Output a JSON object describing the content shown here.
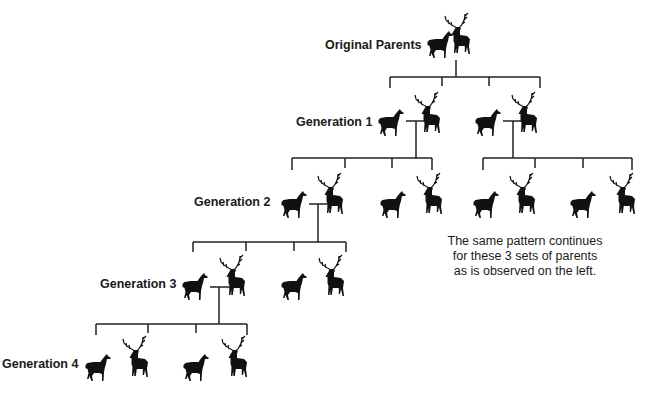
{
  "diagram": {
    "levels": [
      {
        "label": "Original Parents",
        "pairs": 1
      },
      {
        "label": "Generation 1",
        "pairs": 2
      },
      {
        "label": "Generation 2",
        "pairs": 4
      },
      {
        "label": "Generation 3",
        "pairs": 2
      },
      {
        "label": "Generation 4",
        "pairs": 2
      }
    ],
    "note": {
      "line1": "The same pattern continues",
      "line2": "for these 3 sets of parents",
      "line3": "as is observed on the left."
    },
    "colors": {
      "silhouette": "#111111",
      "line": "#222222",
      "background": "#ffffff"
    }
  }
}
